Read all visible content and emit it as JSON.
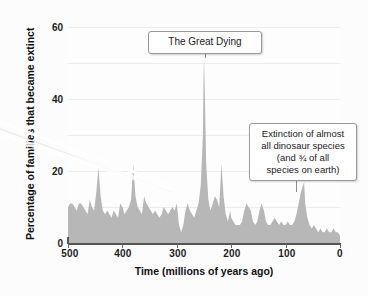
{
  "chart_data": {
    "type": "area",
    "title": "",
    "xlabel": "Time  (millions of years ago)",
    "ylabel": "Percentage of families that became extinct",
    "xlim": [
      500,
      0
    ],
    "ylim": [
      0,
      60
    ],
    "x_reversed": true,
    "grid": true,
    "legend": null,
    "xticks": [
      500,
      400,
      300,
      200,
      100,
      0
    ],
    "yticks": [
      0,
      20,
      40,
      60
    ],
    "fill_color": "#b7b7b7",
    "series": [
      {
        "name": "Extinction intensity",
        "units": "percent of marine families going extinct",
        "x": [
          500,
          496,
          492,
          488,
          484,
          480,
          476,
          472,
          468,
          464,
          460,
          456,
          452,
          448,
          444,
          440,
          436,
          432,
          428,
          424,
          420,
          416,
          412,
          408,
          404,
          400,
          396,
          392,
          388,
          384,
          380,
          376,
          372,
          368,
          364,
          360,
          356,
          352,
          348,
          344,
          340,
          336,
          332,
          328,
          324,
          320,
          316,
          312,
          308,
          304,
          300,
          296,
          292,
          288,
          284,
          280,
          276,
          272,
          268,
          264,
          260,
          256,
          252,
          251,
          250,
          248,
          246,
          242,
          238,
          234,
          230,
          226,
          222,
          218,
          214,
          210,
          206,
          202,
          200,
          196,
          192,
          188,
          184,
          180,
          176,
          172,
          168,
          164,
          160,
          156,
          152,
          148,
          144,
          140,
          136,
          132,
          128,
          124,
          120,
          116,
          112,
          108,
          104,
          100,
          96,
          92,
          88,
          84,
          80,
          76,
          72,
          68,
          66,
          64,
          60,
          56,
          52,
          48,
          44,
          40,
          36,
          32,
          28,
          24,
          20,
          16,
          12,
          8,
          4,
          0
        ],
        "y": [
          10,
          11,
          11,
          10,
          9,
          11,
          11,
          10,
          9,
          8,
          12,
          10,
          9,
          14,
          21,
          13,
          9,
          8,
          9,
          8,
          7,
          9,
          8,
          7,
          11,
          10,
          8,
          9,
          10,
          12,
          22,
          13,
          10,
          9,
          8,
          13,
          11,
          10,
          9,
          8,
          9,
          8,
          7,
          8,
          10,
          9,
          8,
          9,
          10,
          9,
          11,
          5,
          3,
          5,
          9,
          11,
          9,
          8,
          7,
          9,
          11,
          16,
          30,
          44,
          52,
          38,
          22,
          12,
          9,
          11,
          13,
          12,
          10,
          22,
          13,
          8,
          6,
          9,
          7,
          6,
          5,
          5,
          5,
          6,
          9,
          11,
          10,
          9,
          6,
          5,
          6,
          9,
          11,
          9,
          6,
          5,
          5,
          6,
          7,
          6,
          5,
          6,
          5,
          5,
          6,
          5,
          5,
          6,
          8,
          11,
          14,
          16,
          17,
          11,
          7,
          5,
          4,
          5,
          4,
          3,
          4,
          3,
          3,
          4,
          3,
          3,
          4,
          3,
          3,
          2
        ]
      }
    ],
    "mass_extinction_events": [
      {
        "name": "Ordovician-Silurian",
        "x": 444,
        "y": 21
      },
      {
        "name": "Late Devonian",
        "x": 380,
        "y": 22
      },
      {
        "name": "Permian-Triassic (The Great Dying)",
        "x": 250,
        "y": 52
      },
      {
        "name": "Triassic-Jurassic",
        "x": 218,
        "y": 22
      },
      {
        "name": "Cretaceous-Paleogene",
        "x": 66,
        "y": 17
      }
    ],
    "annotations": [
      {
        "id": "great-dying",
        "text": "The Great Dying",
        "points_to_x": 250,
        "points_to_y": 52
      },
      {
        "id": "dinosaur-extinction",
        "lines": [
          "Extinction of almost",
          "all dinosaur species",
          "(and ¾ of all",
          "species on earth)"
        ],
        "points_to_x": 66,
        "points_to_y": 17
      }
    ]
  },
  "axes": {
    "y_title": "Percentage of families that became extinct",
    "x_title": "Time  (millions of years ago)",
    "x_tick_labels": [
      "500",
      "400",
      "300",
      "200",
      "100",
      "0"
    ],
    "y_tick_labels": [
      "0",
      "20",
      "40",
      "60"
    ]
  },
  "annotations": {
    "great_dying": {
      "label": "The Great Dying"
    },
    "dinosaur": {
      "line1": "Extinction of almost",
      "line2": "all dinosaur species",
      "line3": "(and ¾ of all",
      "line4": "species on earth)"
    }
  }
}
